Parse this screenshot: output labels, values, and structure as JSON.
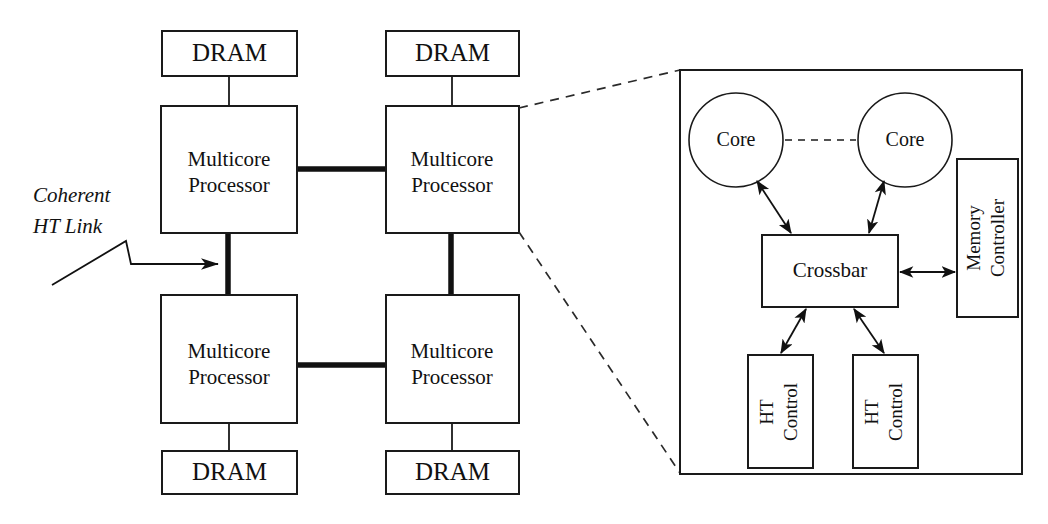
{
  "diagram": {
    "colors": {
      "stroke": "#1a1a1a",
      "background": "#ffffff",
      "thick_link": "#111111"
    },
    "annotation": {
      "line1": "Coherent",
      "line2": "HT Link"
    },
    "memory_modules": [
      {
        "label": "DRAM",
        "position": "top-left"
      },
      {
        "label": "DRAM",
        "position": "top-right"
      },
      {
        "label": "DRAM",
        "position": "bottom-left"
      },
      {
        "label": "DRAM",
        "position": "bottom-right"
      }
    ],
    "processors": [
      {
        "line1": "Multicore",
        "line2": "Processor",
        "position": "top-left"
      },
      {
        "line1": "Multicore",
        "line2": "Processor",
        "position": "top-right"
      },
      {
        "line1": "Multicore",
        "line2": "Processor",
        "position": "bottom-left"
      },
      {
        "line1": "Multicore",
        "line2": "Processor",
        "position": "bottom-right"
      }
    ],
    "detail": {
      "cores": [
        {
          "label": "Core",
          "position": "left"
        },
        {
          "label": "Core",
          "position": "right"
        }
      ],
      "crossbar": {
        "label": "Crossbar"
      },
      "memory_controller": {
        "line1": "Memory",
        "line2": "Controller"
      },
      "ht_controls": [
        {
          "line1": "HT",
          "line2": "Control",
          "position": "left"
        },
        {
          "line1": "HT",
          "line2": "Control",
          "position": "right"
        }
      ]
    }
  }
}
